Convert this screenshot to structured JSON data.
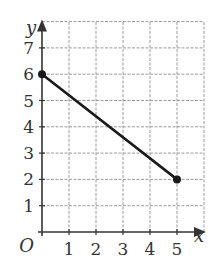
{
  "chart_data": {
    "type": "line",
    "title": "",
    "xlabel": "x",
    "ylabel": "y",
    "origin_label": "O",
    "xlim": [
      0,
      6
    ],
    "ylim": [
      0,
      8
    ],
    "x_ticks": [
      "1",
      "2",
      "3",
      "4",
      "5"
    ],
    "y_ticks": [
      "1",
      "2",
      "3",
      "4",
      "5",
      "6",
      "7"
    ],
    "grid": true,
    "grid_style": "dashed",
    "series": [
      {
        "name": "segment",
        "x": [
          0,
          5
        ],
        "y": [
          6,
          2
        ],
        "endpoints": "filled-dots"
      }
    ]
  },
  "colors": {
    "line": "#1a1a1a",
    "grid": "#9a9a9a",
    "axis": "#333333",
    "text": "#333333"
  }
}
